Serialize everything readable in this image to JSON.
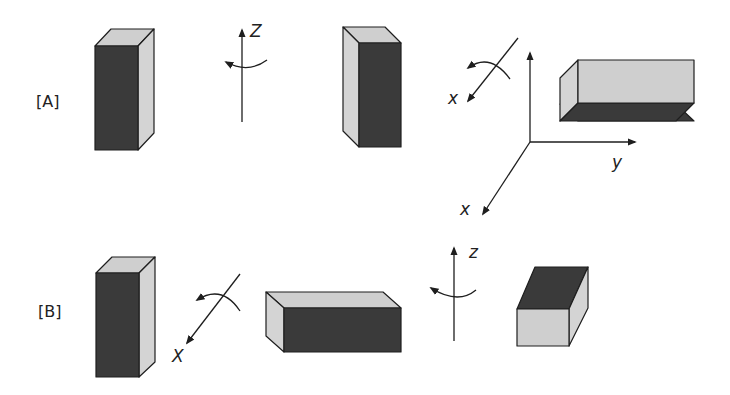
{
  "diagram": {
    "rows": [
      {
        "id": "A",
        "label": "[A]"
      },
      {
        "id": "B",
        "label": "[B]"
      }
    ],
    "axis_labels": {
      "a_rot_z": "Z",
      "a_rot_x": "x",
      "frame_x": "x",
      "frame_y": "y",
      "b_rot_x": "X",
      "b_rot_z": "z"
    },
    "colors": {
      "dark_face": "#3a3a3a",
      "light_face": "#cfcfcf",
      "outline": "#1e1e1e",
      "background": "#ffffff"
    }
  }
}
